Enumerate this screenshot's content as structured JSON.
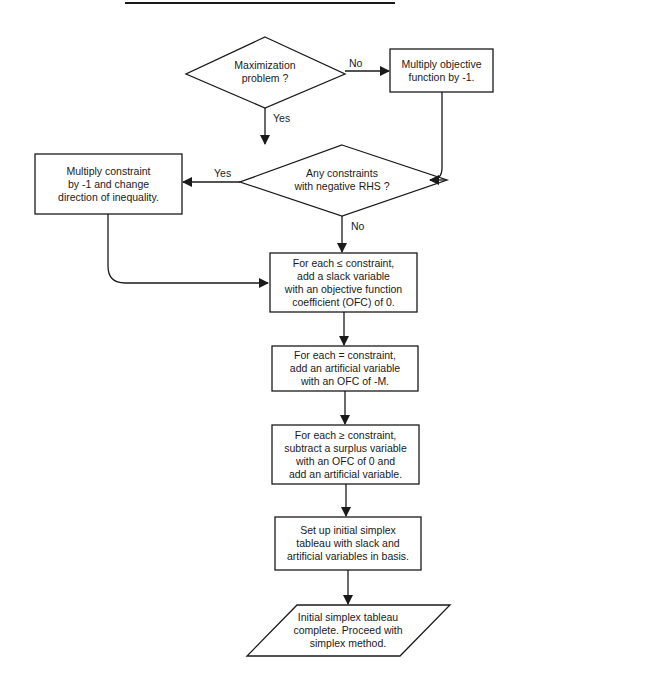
{
  "title_fragment": "",
  "colors": {
    "stroke": "#1a1a1a",
    "background": "#ffffff"
  },
  "nodes": {
    "maximization": {
      "type": "decision",
      "lines": [
        "Maximization",
        "problem ?"
      ]
    },
    "multiply_objective": {
      "type": "process",
      "lines": [
        "Multiply objective",
        "function by -1."
      ]
    },
    "negative_rhs": {
      "type": "decision",
      "lines": [
        "Any constraints",
        "with negative RHS ?"
      ]
    },
    "multiply_constraint": {
      "type": "process",
      "lines": [
        "Multiply constraint",
        "by -1 and change",
        "direction of inequality."
      ]
    },
    "slack": {
      "type": "process",
      "lines": [
        "For each ≤ constraint,",
        "add a slack variable",
        "with an objective function",
        "coefficient (OFC) of 0."
      ]
    },
    "artificial_eq": {
      "type": "process",
      "lines": [
        "For each = constraint,",
        "add an artificial variable",
        "with an OFC of -M."
      ]
    },
    "surplus": {
      "type": "process",
      "lines": [
        "For each ≥ constraint,",
        "subtract a surplus variable",
        "with an OFC of 0 and",
        "add an artificial variable."
      ]
    },
    "setup_tableau": {
      "type": "process",
      "lines": [
        "Set up initial simplex",
        "tableau with slack and",
        "artificial variables in basis."
      ]
    },
    "complete": {
      "type": "terminal-io",
      "lines": [
        "Initial simplex tableau",
        "complete.  Proceed with",
        "simplex method."
      ]
    }
  },
  "edges": {
    "max_no": "No",
    "max_yes": "Yes",
    "rhs_yes": "Yes",
    "rhs_no": "No"
  }
}
